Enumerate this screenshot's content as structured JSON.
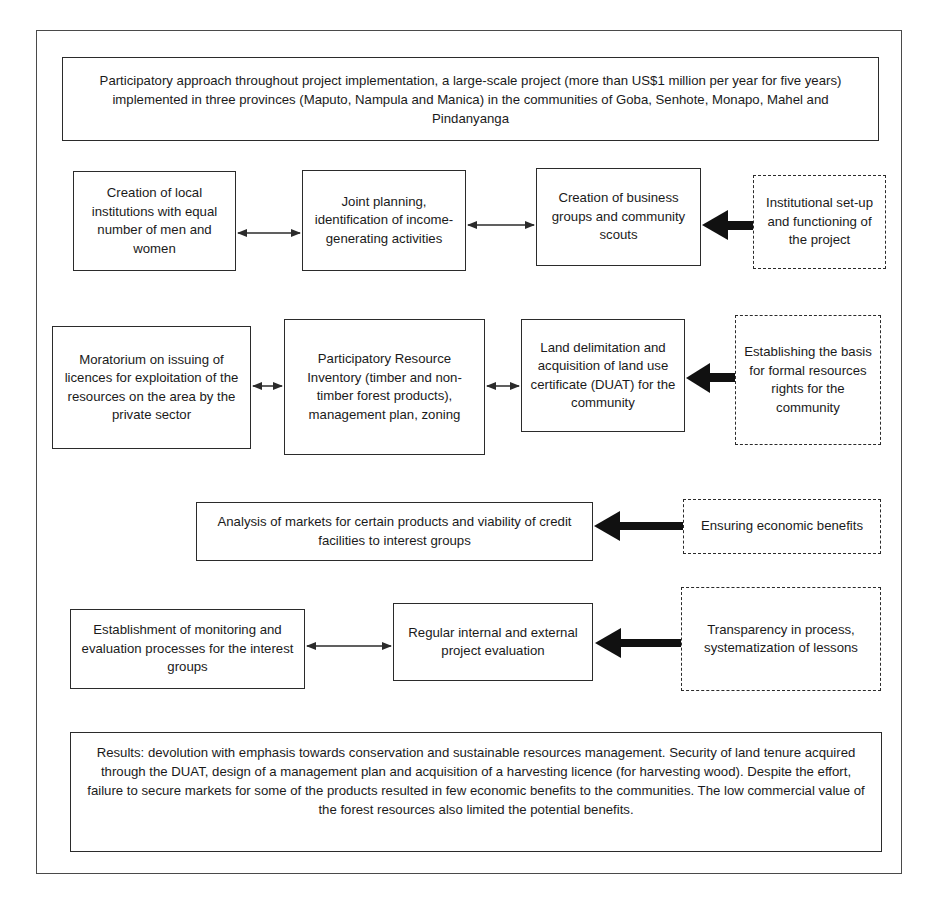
{
  "diagram": {
    "header": {
      "text": "Participatory approach throughout project implementation, a large-scale project (more than US$1 million per year for five years) implemented in three provinces (Maputo, Nampula and Manica) in the communities of Goba, Senhote, Monapo, Mahel and Pindanyanga"
    },
    "row1": {
      "activities": [
        "Creation of local institutions with equal number of men and women",
        "Joint planning, identification of income-generating activities",
        "Creation of business groups and community scouts"
      ],
      "driver": "Institutional set-up and functioning of the project"
    },
    "row2": {
      "activities": [
        "Moratorium on issuing of licences for exploitation of the resources on the area by the private sector",
        "Participatory Resource Inventory (timber and non-timber forest products), management plan, zoning",
        "Land delimitation and acquisition of land use certificate (DUAT) for the community"
      ],
      "driver": "Establishing the basis for formal resources rights for the community"
    },
    "row3": {
      "activities": [
        "Analysis of markets for certain products and viability of credit facilities to interest groups"
      ],
      "driver": "Ensuring economic benefits"
    },
    "row4": {
      "activities": [
        "Establishment of monitoring and evaluation processes for the interest groups",
        "Regular internal and external project evaluation"
      ],
      "driver": "Transparency in process, systematization of lessons"
    },
    "results": {
      "text": "Results: devolution with emphasis towards conservation and sustainable resources management. Security of land tenure acquired through the DUAT, design of a management plan and acquisition of a harvesting licence (for harvesting wood). Despite the effort, failure to secure markets for some of the products resulted in few economic benefits to the communities. The low commercial value of the forest resources also limited the potential benefits."
    },
    "legend": {
      "solid_box": "activity",
      "dashed_box": "driver / objective",
      "thin_double_arrow": "linked activities",
      "thick_arrow": "driver leads to activity"
    }
  }
}
